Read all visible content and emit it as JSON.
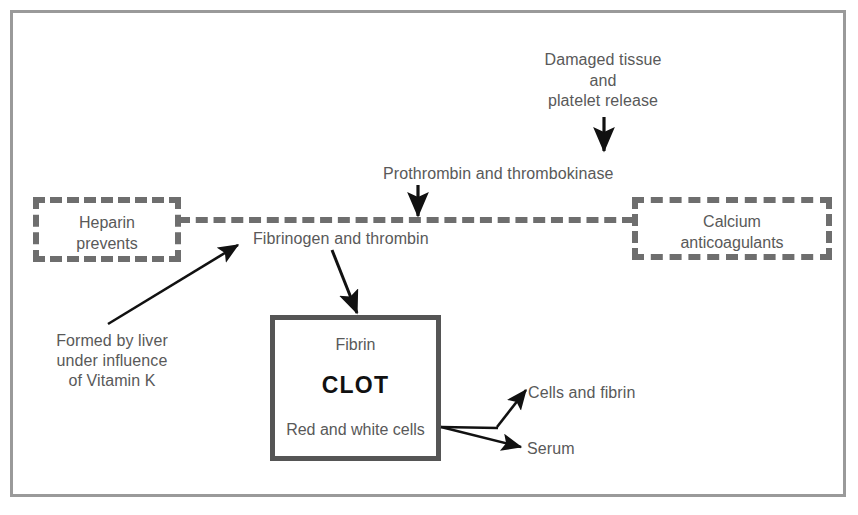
{
  "diagram": {
    "frame_color": "#9a9a9a",
    "text_color": "#595959",
    "dash_color": "#6e6e6e",
    "solid_box_color": "#555555"
  },
  "boxes": {
    "heparin": {
      "line1": "Heparin",
      "line2": "prevents"
    },
    "calcium": {
      "line1": "Calcium",
      "line2": "anticoagulants"
    },
    "clot": {
      "line1": "Fibrin",
      "line2": "CLOT",
      "line3": "Red and white cells"
    }
  },
  "labels": {
    "damaged_tissue_line1": "Damaged tissue",
    "damaged_tissue_line2": "and",
    "damaged_tissue_line3": "platelet release",
    "prothrombin": "Prothrombin and thrombokinase",
    "fibrinogen": "Fibrinogen and thrombin",
    "liver_line1": "Formed by liver",
    "liver_line2": "under influence",
    "liver_line3": "of Vitamin K",
    "cells_and_fibrin": "Cells and fibrin",
    "serum": "Serum"
  }
}
